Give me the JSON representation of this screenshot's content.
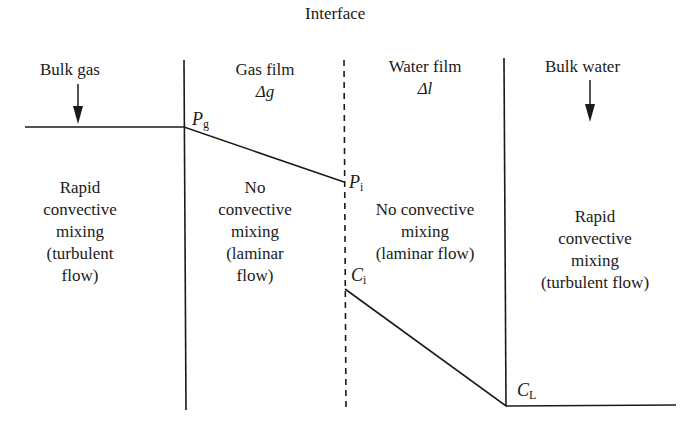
{
  "title": "Interface",
  "zones": {
    "bulk_gas": {
      "label": "Bulk gas",
      "description": [
        "Rapid",
        "convective",
        "mixing",
        "(turbulent",
        "flow)"
      ]
    },
    "gas_film": {
      "label": "Gas film",
      "thickness": "Δg",
      "description": [
        "No",
        "convective",
        "mixing",
        "(laminar",
        "flow)"
      ]
    },
    "water_film": {
      "label": "Water film",
      "thickness": "Δl",
      "description": [
        "No convective",
        "mixing",
        "(laminar flow)"
      ]
    },
    "bulk_water": {
      "label": "Bulk water",
      "description": [
        "Rapid",
        "convective",
        "mixing",
        "(turbulent flow)"
      ]
    }
  },
  "points": {
    "pg": {
      "main": "P",
      "sub": "g"
    },
    "pi": {
      "main": "P",
      "sub": "i"
    },
    "ci": {
      "main": "C",
      "sub": "i"
    },
    "cl": {
      "main": "C",
      "sub": "L"
    }
  },
  "colors": {
    "line": "#1a1a1a",
    "background": "#ffffff"
  }
}
